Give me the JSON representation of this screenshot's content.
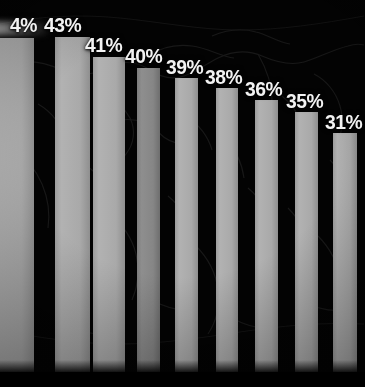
{
  "chart_data": {
    "type": "bar",
    "title": "",
    "subtitle": "",
    "xlabel": "",
    "ylabel": "",
    "grid": false,
    "legend": null,
    "ylim": [
      0,
      48
    ],
    "categories": [
      "1",
      "2",
      "3",
      "4",
      "5",
      "6",
      "7",
      "8",
      "9"
    ],
    "values": [
      44,
      43,
      41,
      40,
      39,
      38,
      36,
      35,
      31
    ],
    "data_labels": [
      "4%",
      "43%",
      "41%",
      "40%",
      "39%",
      "38%",
      "36%",
      "35%",
      "31%"
    ],
    "bars": [
      {
        "label": "4%",
        "value": 44,
        "left": -10,
        "width": 44,
        "top": 38,
        "label_x": 10,
        "label_y": 14,
        "textured": false,
        "cropped": true
      },
      {
        "label": "43%",
        "value": 43,
        "left": 55,
        "width": 35,
        "top": 37,
        "label_x": 44,
        "label_y": 14,
        "textured": false,
        "cropped": false
      },
      {
        "label": "41%",
        "value": 41,
        "left": 93,
        "width": 32,
        "top": 57,
        "label_x": 85,
        "label_y": 34,
        "textured": false,
        "cropped": false
      },
      {
        "label": "40%",
        "value": 40,
        "left": 137,
        "width": 23,
        "top": 68,
        "label_x": 125,
        "label_y": 45,
        "textured": true,
        "cropped": false
      },
      {
        "label": "39%",
        "value": 39,
        "left": 175,
        "width": 23,
        "top": 78,
        "label_x": 166,
        "label_y": 56,
        "textured": false,
        "cropped": false
      },
      {
        "label": "38%",
        "value": 38,
        "left": 216,
        "width": 22,
        "top": 88,
        "label_x": 205,
        "label_y": 66,
        "textured": false,
        "cropped": false
      },
      {
        "label": "36%",
        "value": 36,
        "left": 255,
        "width": 23,
        "top": 100,
        "label_x": 245,
        "label_y": 78,
        "textured": false,
        "cropped": false
      },
      {
        "label": "35%",
        "value": 35,
        "left": 295,
        "width": 23,
        "top": 112,
        "label_x": 286,
        "label_y": 90,
        "textured": false,
        "cropped": false
      },
      {
        "label": "31%",
        "value": 31,
        "left": 333,
        "width": 24,
        "top": 133,
        "label_x": 325,
        "label_y": 111,
        "textured": false,
        "cropped": false
      }
    ],
    "colors": {
      "background": "#030303",
      "bar": "#a9a9a9",
      "bar_alt": "#868686",
      "label_text": "#f2f2f2",
      "map_stroke": "#2a2a2a"
    }
  }
}
